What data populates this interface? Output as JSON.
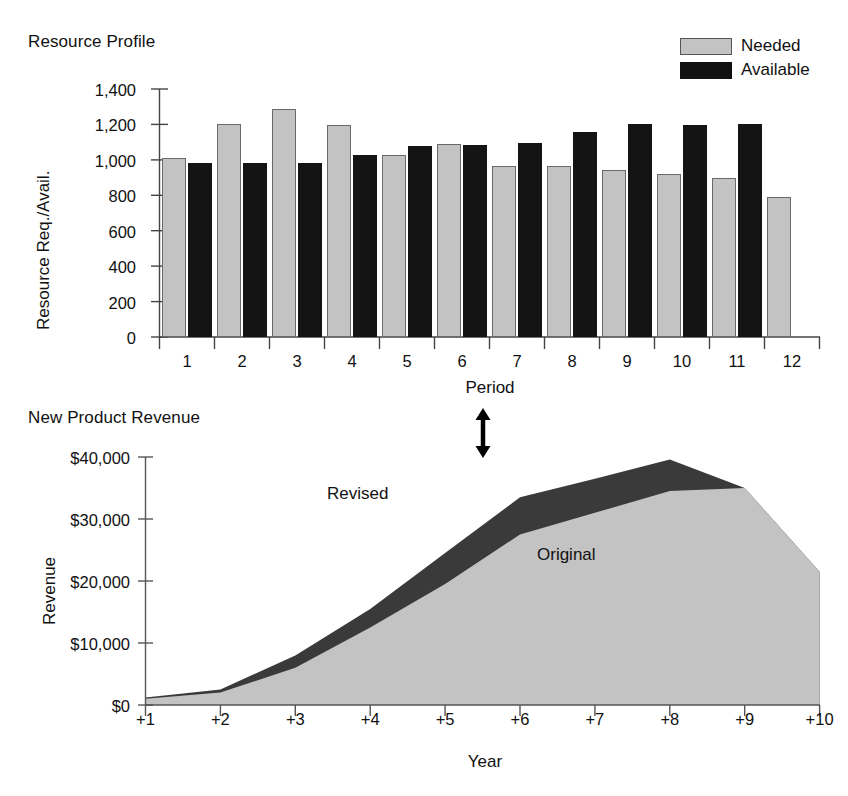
{
  "top_chart": {
    "title": "Resource Profile",
    "ylabel": "Resource Req./Avail.",
    "xlabel": "Period",
    "legend": [
      {
        "label": "Needed",
        "color": "#c3c3c3"
      },
      {
        "label": "Available",
        "color": "#111111"
      }
    ]
  },
  "bottom_chart": {
    "title": "New Product Revenue",
    "ylabel": "Revenue",
    "xlabel": "Year",
    "annotations": [
      {
        "label": "Revised",
        "color": "#3a3a3a"
      },
      {
        "label": "Original",
        "color": "#c3c3c3"
      }
    ]
  },
  "connector": {
    "icon": "double-arrow-vertical"
  },
  "chart_data": [
    {
      "type": "bar",
      "title": "Resource Profile",
      "xlabel": "Period",
      "ylabel": "Resource Req./Avail.",
      "categories": [
        "1",
        "2",
        "3",
        "4",
        "5",
        "6",
        "7",
        "8",
        "9",
        "10",
        "11",
        "12"
      ],
      "ylim": [
        0,
        1400
      ],
      "yticks": [
        0,
        200,
        400,
        600,
        800,
        1000,
        1200,
        1400
      ],
      "yticklabels": [
        "0",
        "200",
        "400",
        "600",
        "800",
        "1,000",
        "1,200",
        "1,400"
      ],
      "grid": false,
      "legend_position": "top-right",
      "series": [
        {
          "name": "Needed",
          "color": "#c3c3c3",
          "values": [
            1010,
            1200,
            1290,
            1195,
            1030,
            1090,
            965,
            965,
            945,
            920,
            895,
            790
          ]
        },
        {
          "name": "Available",
          "color": "#111111",
          "values": [
            985,
            980,
            985,
            1030,
            1080,
            1085,
            1095,
            1160,
            1200,
            1195,
            1200,
            null
          ]
        }
      ]
    },
    {
      "type": "area",
      "title": "New Product Revenue",
      "xlabel": "Year",
      "ylabel": "Revenue",
      "x": [
        "+1",
        "+2",
        "+3",
        "+4",
        "+5",
        "+6",
        "+7",
        "+8",
        "+9",
        "+10"
      ],
      "ylim": [
        0,
        42000
      ],
      "yticks": [
        0,
        10000,
        20000,
        30000,
        40000
      ],
      "yticklabels": [
        "$0",
        "$10,000",
        "$20,000",
        "$30,000",
        "$40,000"
      ],
      "grid": false,
      "stacked": false,
      "series": [
        {
          "name": "Original",
          "color": "#c3c3c3",
          "values": [
            1000,
            2000,
            6000,
            12500,
            19500,
            27500,
            31000,
            34500,
            35000,
            21500
          ]
        },
        {
          "name": "Revised",
          "color": "#3a3a3a",
          "values": [
            1200,
            2500,
            8000,
            15500,
            24500,
            33500,
            36500,
            39600,
            35000,
            21500
          ]
        }
      ]
    }
  ]
}
